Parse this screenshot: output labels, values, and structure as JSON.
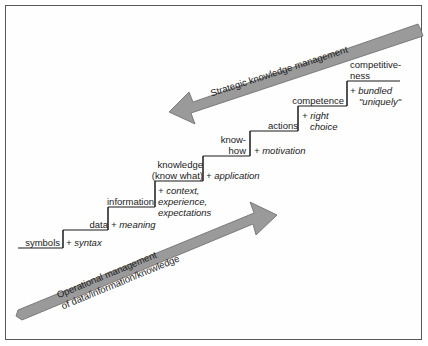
{
  "figure": {
    "border_color": "#58585a",
    "arrow_fill": "#9a9a9a",
    "arrow_stroke": "#5e5e5e",
    "line_color": "#1b1b1b",
    "text_color": "#1b1b1b"
  },
  "arrows": [
    {
      "id": "operational",
      "direction": "up-right",
      "line1": "Operational management",
      "line2": "of data/information/knowledge"
    },
    {
      "id": "strategic",
      "direction": "down-left",
      "line1": "Strategic knowledge management",
      "line2": ""
    }
  ],
  "steps": [
    {
      "id": "symbols",
      "term_lines": [
        "symbols"
      ],
      "qualifier_lines": [
        "+ syntax"
      ]
    },
    {
      "id": "data",
      "term_lines": [
        "data"
      ],
      "qualifier_lines": [
        "+ meaning"
      ]
    },
    {
      "id": "information",
      "term_lines": [
        "information"
      ],
      "qualifier_lines": [
        "+ context,",
        "experience,",
        "expectations"
      ]
    },
    {
      "id": "knowledge",
      "term_lines": [
        "knowledge",
        "(know what)"
      ],
      "qualifier_lines": [
        "+ application"
      ]
    },
    {
      "id": "know-how",
      "term_lines": [
        "know-",
        "how"
      ],
      "qualifier_lines": [
        "+ motivation"
      ]
    },
    {
      "id": "actions",
      "term_lines": [
        "actions"
      ],
      "qualifier_lines": [
        "+ right",
        "choice"
      ]
    },
    {
      "id": "competence",
      "term_lines": [
        "competence"
      ],
      "qualifier_lines": [
        "+ bundled",
        "\"uniquely\""
      ]
    },
    {
      "id": "competitiveness",
      "term_lines": [
        "competitive-",
        "ness"
      ],
      "qualifier_lines": []
    }
  ]
}
